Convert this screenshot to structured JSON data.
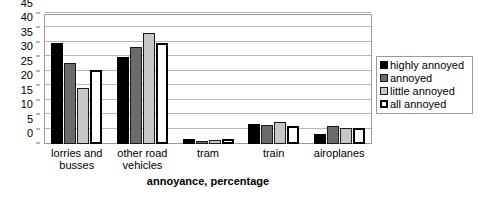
{
  "chart_data": {
    "type": "bar",
    "title": "",
    "subtitle": "",
    "xlabel": "annoyance, percentage",
    "ylabel": "",
    "categories": [
      "lorries and\nbusses",
      "other road\nvehicles",
      "tram",
      "train",
      "airoplanes"
    ],
    "series": [
      {
        "name": "highly annoyed",
        "color": "#000000",
        "values": [
          35,
          30,
          1.8,
          6.8,
          3.3
        ]
      },
      {
        "name": "annoyed",
        "color": "#6b6b6b",
        "values": [
          28,
          33.5,
          1.2,
          6.7,
          6.4
        ]
      },
      {
        "name": "little annoyed",
        "color": "#c6c6c6",
        "values": [
          19.5,
          38.5,
          1.5,
          7.5,
          5.5
        ]
      },
      {
        "name": "all annoyed",
        "color": "#ffffff",
        "values": [
          25.5,
          35,
          1.7,
          6.3,
          5.7
        ]
      }
    ],
    "ylim": [
      0,
      45
    ],
    "yticks": [
      0,
      5,
      10,
      15,
      20,
      25,
      30,
      35,
      40,
      45
    ],
    "ytick_labels": [
      "0",
      "5",
      "10",
      "15",
      "20",
      "25",
      "30",
      "35",
      "40",
      "45"
    ],
    "grid": true,
    "grid_axis": "y",
    "legend_position": "right",
    "legend_entries": [
      "highly annoyed",
      "annoyed",
      "little annoyed",
      "all annoyed"
    ]
  }
}
